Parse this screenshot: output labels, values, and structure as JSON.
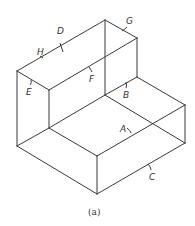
{
  "figure": {
    "caption": "(a)",
    "stroke_color": "#3a3a3a",
    "labels": {
      "A": "A",
      "B": "B",
      "C": "C",
      "D": "D",
      "E": "E",
      "F": "F",
      "G": "G",
      "H": "H"
    }
  }
}
